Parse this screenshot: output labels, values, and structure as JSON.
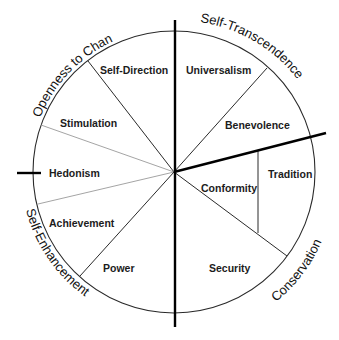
{
  "colors": {
    "background": "#ffffff",
    "line": "#2a2a2a",
    "faint_line": "#9a9a9a",
    "divider": "#000000",
    "text": "#1c1c1c"
  },
  "values": {
    "self_direction": "Self-Direction",
    "universalism": "Universalism",
    "benevolence": "Benevolence",
    "tradition": "Tradition",
    "conformity": "Conformity",
    "security": "Security",
    "power": "Power",
    "achievement": "Achievement",
    "hedonism": "Hedonism",
    "stimulation": "Stimulation"
  },
  "higher_order": {
    "openness": "Openness to Change",
    "self_transcendence": "Self-Transcendence",
    "conservation": "Conservation",
    "self_enhancement": "Self-Enhancement"
  }
}
